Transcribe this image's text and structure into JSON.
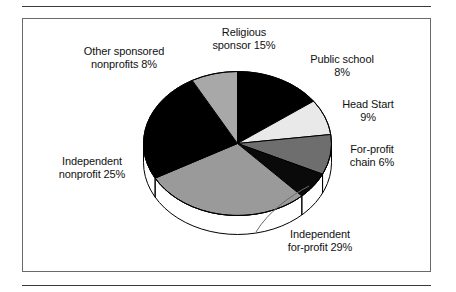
{
  "figure": {
    "frame_color": "#6a6a6a",
    "background": "#ffffff",
    "rule_color": "#3a3a3a"
  },
  "chart_data": {
    "type": "pie",
    "title": "",
    "subtitle": "",
    "xlabel": "",
    "ylabel": "",
    "legend_position": "none",
    "labels_position": "outside-callout",
    "three_d": true,
    "start_angle_deg": 0,
    "direction": "clockwise",
    "units": "percent",
    "total": 100,
    "categories": [
      "Religious sponsor",
      "Public school",
      "Head Start",
      "For-profit chain",
      "Independent for-profit",
      "Independent nonprofit",
      "Other sponsored nonprofits"
    ],
    "values": [
      15,
      8,
      9,
      6,
      29,
      25,
      8
    ],
    "slices": [
      {
        "name": "Religious sponsor",
        "value": 15,
        "value_text": "15%",
        "label_line1": "Religious",
        "label_line2": "sponsor 15%",
        "label_full": "Religious sponsor 15%",
        "color": "#000000",
        "start_deg": 0,
        "end_deg": 54
      },
      {
        "name": "Public school",
        "value": 8,
        "value_text": "8%",
        "label_line1": "Public school",
        "label_line2": "8%",
        "label_full": "Public school 8%",
        "color": "#e9e9e9",
        "start_deg": 54,
        "end_deg": 82.8
      },
      {
        "name": "Head Start",
        "value": 9,
        "value_text": "9%",
        "label_line1": "Head Start",
        "label_line2": "9%",
        "label_full": "Head Start 9%",
        "color": "#6e6e6e",
        "start_deg": 82.8,
        "end_deg": 115.2
      },
      {
        "name": "For-profit chain",
        "value": 6,
        "value_text": "6%",
        "label_line1": "For-profit",
        "label_line2": "chain 6%",
        "label_full": "For-profit chain 6%",
        "color": "#0a0a0a",
        "start_deg": 115.2,
        "end_deg": 136.8
      },
      {
        "name": "Independent for-profit",
        "value": 29,
        "value_text": "29%",
        "label_line1": "Independent",
        "label_line2": "for-profit 29%",
        "label_full": "Independent for-profit 29%",
        "color": "#9a9a9a",
        "start_deg": 136.8,
        "end_deg": 241.2
      },
      {
        "name": "Independent nonprofit",
        "value": 25,
        "value_text": "25%",
        "label_line1": "Independent",
        "label_line2": "nonprofit 25%",
        "label_full": "Independent nonprofit 25%",
        "color": "#000000",
        "start_deg": 241.2,
        "end_deg": 331.2
      },
      {
        "name": "Other sponsored nonprofits",
        "value": 8,
        "value_text": "8%",
        "label_line1": "Other sponsored",
        "label_line2": "nonprofits 8%",
        "label_full": "Other sponsored nonprofits 8%",
        "color": "#a8a8a8",
        "start_deg": 331.2,
        "end_deg": 360
      }
    ]
  }
}
